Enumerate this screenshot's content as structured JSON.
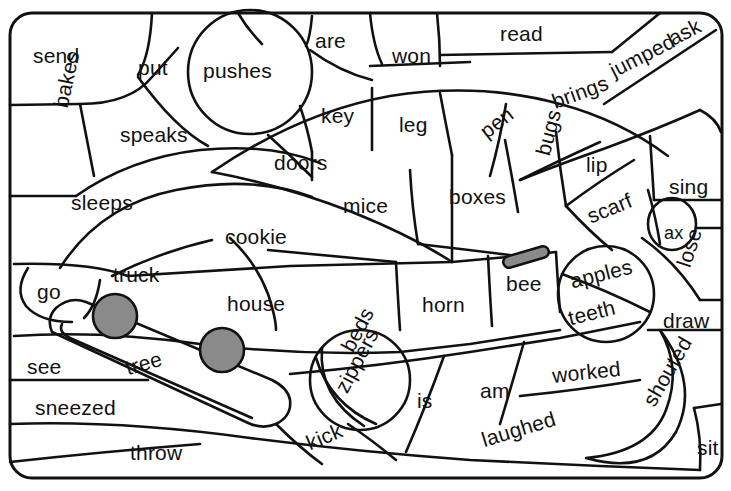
{
  "page": {
    "kind": "word-coloring-puzzle-worksheet",
    "width": 731,
    "height": 491,
    "background_color": "#ffffff",
    "ink_color": "#111111",
    "fill_color": "#8a8a8a",
    "subject": "truck"
  },
  "words": [
    {
      "text": "send",
      "x": 33,
      "y": 45,
      "rot": 0,
      "size": ""
    },
    {
      "text": "put",
      "x": 138,
      "y": 57,
      "rot": 0,
      "size": ""
    },
    {
      "text": "pushes",
      "x": 203,
      "y": 60,
      "rot": 0,
      "size": ""
    },
    {
      "text": "are",
      "x": 315,
      "y": 30,
      "rot": 0,
      "size": ""
    },
    {
      "text": "won",
      "x": 392,
      "y": 45,
      "rot": 0,
      "size": ""
    },
    {
      "text": "read",
      "x": 500,
      "y": 23,
      "rot": 0,
      "size": ""
    },
    {
      "text": "ask",
      "x": 665,
      "y": 30,
      "rot": -27,
      "size": ""
    },
    {
      "text": "jumped",
      "x": 606,
      "y": 62,
      "rot": -27,
      "size": ""
    },
    {
      "text": "brings",
      "x": 549,
      "y": 92,
      "rot": -20,
      "size": ""
    },
    {
      "text": "bakes",
      "x": 50,
      "y": 105,
      "rot": -78,
      "size": ""
    },
    {
      "text": "speaks",
      "x": 120,
      "y": 124,
      "rot": 0,
      "size": ""
    },
    {
      "text": "key",
      "x": 321,
      "y": 105,
      "rot": 0,
      "size": ""
    },
    {
      "text": "leg",
      "x": 399,
      "y": 114,
      "rot": 0,
      "size": ""
    },
    {
      "text": "pen",
      "x": 476,
      "y": 125,
      "rot": -38,
      "size": ""
    },
    {
      "text": "doors",
      "x": 274,
      "y": 152,
      "rot": 0,
      "size": ""
    },
    {
      "text": "bugs",
      "x": 532,
      "y": 152,
      "rot": -75,
      "size": ""
    },
    {
      "text": "lip",
      "x": 586,
      "y": 154,
      "rot": 0,
      "size": ""
    },
    {
      "text": "sing",
      "x": 669,
      "y": 176,
      "rot": 0,
      "size": ""
    },
    {
      "text": "sleeps",
      "x": 71,
      "y": 192,
      "rot": 0,
      "size": ""
    },
    {
      "text": "mice",
      "x": 343,
      "y": 195,
      "rot": 0,
      "size": ""
    },
    {
      "text": "boxes",
      "x": 449,
      "y": 186,
      "rot": 0,
      "size": ""
    },
    {
      "text": "scarf",
      "x": 584,
      "y": 207,
      "rot": -22,
      "size": ""
    },
    {
      "text": "cookie",
      "x": 225,
      "y": 226,
      "rot": 0,
      "size": ""
    },
    {
      "text": "ax",
      "x": 664,
      "y": 224,
      "rot": 0,
      "size": "small"
    },
    {
      "text": "go",
      "x": 37,
      "y": 281,
      "rot": 0,
      "size": ""
    },
    {
      "text": "truck",
      "x": 113,
      "y": 264,
      "rot": 0,
      "size": ""
    },
    {
      "text": "house",
      "x": 227,
      "y": 293,
      "rot": 0,
      "size": ""
    },
    {
      "text": "horn",
      "x": 422,
      "y": 294,
      "rot": 0,
      "size": ""
    },
    {
      "text": "bee",
      "x": 506,
      "y": 273,
      "rot": 0,
      "size": ""
    },
    {
      "text": "apples",
      "x": 568,
      "y": 271,
      "rot": -14,
      "size": ""
    },
    {
      "text": "teeth",
      "x": 566,
      "y": 308,
      "rot": -14,
      "size": ""
    },
    {
      "text": "lose",
      "x": 673,
      "y": 263,
      "rot": -72,
      "size": ""
    },
    {
      "text": "draw",
      "x": 663,
      "y": 310,
      "rot": 0,
      "size": ""
    },
    {
      "text": "beds",
      "x": 337,
      "y": 345,
      "rot": -62,
      "size": ""
    },
    {
      "text": "see",
      "x": 27,
      "y": 356,
      "rot": 0,
      "size": ""
    },
    {
      "text": "tree",
      "x": 123,
      "y": 358,
      "rot": -16,
      "size": ""
    },
    {
      "text": "worked",
      "x": 551,
      "y": 365,
      "rot": -6,
      "size": ""
    },
    {
      "text": "shouted",
      "x": 639,
      "y": 399,
      "rot": -60,
      "size": ""
    },
    {
      "text": "zippers",
      "x": 331,
      "y": 386,
      "rot": -62,
      "size": ""
    },
    {
      "text": "is",
      "x": 417,
      "y": 390,
      "rot": 0,
      "size": ""
    },
    {
      "text": "am",
      "x": 480,
      "y": 380,
      "rot": 0,
      "size": ""
    },
    {
      "text": "sneezed",
      "x": 35,
      "y": 397,
      "rot": 0,
      "size": ""
    },
    {
      "text": "sit",
      "x": 697,
      "y": 437,
      "rot": 0,
      "size": ""
    },
    {
      "text": "kick",
      "x": 303,
      "y": 434,
      "rot": -23,
      "size": ""
    },
    {
      "text": "laughed",
      "x": 479,
      "y": 430,
      "rot": -17,
      "size": ""
    },
    {
      "text": "throw",
      "x": 130,
      "y": 442,
      "rot": 0,
      "size": ""
    }
  ],
  "shapes": {
    "wheels": [
      {
        "name": "front-wheel",
        "cx": 115,
        "cy": 316,
        "r": 22
      },
      {
        "name": "rear-wheel",
        "cx": 222,
        "cy": 350,
        "r": 22
      }
    ],
    "bar": {
      "name": "gray-bar",
      "x1": 507,
      "y1": 261,
      "x2": 543,
      "y2": 252,
      "w": 11
    }
  }
}
